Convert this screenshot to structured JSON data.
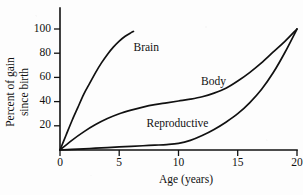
{
  "chart_data": {
    "type": "line",
    "title": "",
    "xlabel": "Age (years)",
    "ylabel_line1": "Percent of gain",
    "ylabel_line2": "since birth",
    "xlim": [
      0,
      20
    ],
    "ylim": [
      0,
      100
    ],
    "grid": false,
    "legend_position": "inline-labels",
    "xticks": [
      0,
      5,
      10,
      15,
      20
    ],
    "xtick_labels": [
      "0",
      "5",
      "10",
      "15",
      "20"
    ],
    "yticks": [
      20,
      40,
      60,
      80,
      100
    ],
    "ytick_labels": [
      "20",
      "40",
      "60",
      "80",
      "100"
    ],
    "line_color": "#111111",
    "background_color": "#fdfdfd",
    "series": [
      {
        "name": "Brain",
        "label": "Brain",
        "x": [
          0,
          0.5,
          1,
          1.5,
          2,
          2.5,
          3,
          3.5,
          4,
          4.5,
          5,
          5.5,
          6,
          6.2
        ],
        "values": [
          0,
          12,
          24,
          35,
          46,
          55,
          64,
          72,
          79,
          85,
          90,
          94,
          97,
          98
        ]
      },
      {
        "name": "Body",
        "label": "Body",
        "x": [
          0,
          1,
          2,
          3,
          4,
          5,
          6,
          7,
          8,
          9,
          10,
          11,
          12,
          13,
          14,
          15,
          16,
          17,
          18,
          19,
          20
        ],
        "values": [
          0,
          8,
          15,
          21,
          26,
          30,
          33,
          35.5,
          37.5,
          39,
          40.5,
          42,
          44,
          47,
          51,
          57,
          64,
          72,
          81,
          90,
          100
        ]
      },
      {
        "name": "Reproductive",
        "label": "Reproductive",
        "x": [
          0,
          1,
          2,
          3,
          4,
          5,
          6,
          7,
          8,
          9,
          10,
          11,
          12,
          13,
          14,
          15,
          16,
          17,
          18,
          19,
          20
        ],
        "values": [
          0,
          0.5,
          1,
          1.5,
          2,
          2.5,
          3,
          3.5,
          4,
          4.5,
          5.5,
          8,
          12,
          17,
          23,
          30,
          39,
          50,
          64,
          81,
          100
        ]
      }
    ],
    "annotations": [
      {
        "text": "Brain",
        "x": 6.2,
        "y": 82
      },
      {
        "text": "Body",
        "x": 11.9,
        "y": 54
      },
      {
        "text": "Reproductive",
        "x": 7.3,
        "y": 19
      }
    ]
  }
}
